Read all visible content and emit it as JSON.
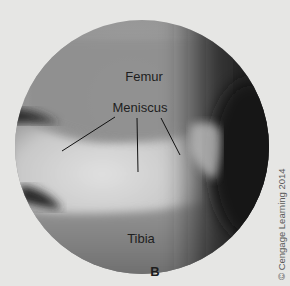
{
  "figure": {
    "panel_letter": "B",
    "labels": {
      "femur": "Femur",
      "meniscus": "Meniscus",
      "tibia": "Tibia"
    },
    "credit": "© Cengage Learning 2014",
    "colors": {
      "background": "#e6e6e4",
      "femur": "#8f8f8f",
      "meniscus": "#d2d2d2",
      "shadow": "#1a1a1a",
      "tibia": "#7a7a7a"
    }
  }
}
